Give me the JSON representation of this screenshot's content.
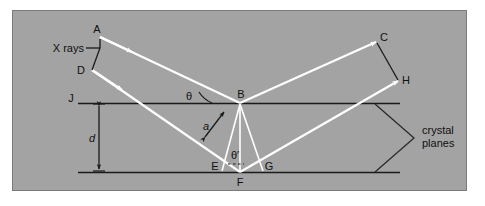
{
  "figure": {
    "panel": {
      "background_color": "#a3a3a3",
      "border_color": "#7b7b7b",
      "outer_background": "#ffffff",
      "x": 12,
      "y": 10,
      "width": 455,
      "height": 181
    },
    "colors": {
      "ray": "#ffffff",
      "plane": "#1a1a1a",
      "text": "#101010",
      "brace": "#2b2b2b",
      "dimension": "#1a1a1a"
    }
  },
  "labels": {
    "x_rays": "X rays",
    "crystal_planes_line1": "crystal",
    "crystal_planes_line2": "planes",
    "spacing": "d",
    "theta": "θ",
    "theta_prime": "θ′",
    "path_segment": "a"
  },
  "points": [
    {
      "id": "A",
      "label": "A",
      "x": 100,
      "y": 37,
      "label_x": 97,
      "label_y": 32
    },
    {
      "id": "D",
      "label": "D",
      "x": 92,
      "y": 70,
      "label_x": 82,
      "label_y": 73
    },
    {
      "id": "J",
      "label": "J",
      "x": 78,
      "y": 103,
      "label_x": 71,
      "label_y": 101
    },
    {
      "id": "B",
      "label": "B",
      "x": 240,
      "y": 103,
      "label_x": 240,
      "label_y": 96
    },
    {
      "id": "E",
      "label": "E",
      "x": 222,
      "y": 172,
      "label_x": 216,
      "label_y": 169
    },
    {
      "id": "F",
      "label": "F",
      "x": 240,
      "y": 172,
      "label_x": 240,
      "label_y": 186
    },
    {
      "id": "G",
      "label": "G",
      "x": 262,
      "y": 172,
      "label_x": 268,
      "label_y": 169
    },
    {
      "id": "C",
      "label": "C",
      "x": 375,
      "y": 42,
      "label_x": 383,
      "label_y": 40
    },
    {
      "id": "H",
      "label": "H",
      "x": 397,
      "y": 80,
      "label_x": 405,
      "label_y": 83
    }
  ],
  "geometry": {
    "plane_top_y": 103,
    "plane_bottom_y": 172,
    "plane_left_x": 78,
    "plane_right_x": 400,
    "spacing_arrow_x": 99,
    "brace_x_left": 375,
    "brace_x_tip": 415,
    "brace_label_x": 422
  },
  "rays": [
    {
      "name": "incident-upper",
      "from": "A",
      "to": "B"
    },
    {
      "name": "incident-lower",
      "from": "D",
      "to": "F"
    },
    {
      "name": "reflected-upper",
      "from": "B",
      "to": "C"
    },
    {
      "name": "reflected-lower",
      "from": "F",
      "to": "H"
    },
    {
      "name": "perpendicular-BE",
      "from": "B",
      "to": "E"
    },
    {
      "name": "perpendicular-BG",
      "from": "B",
      "to": "G"
    },
    {
      "name": "vertical-BF",
      "from": "B",
      "to": "F"
    }
  ],
  "wavefronts": [
    {
      "name": "incoming-wavefront-AD",
      "from": "A",
      "to": "D"
    },
    {
      "name": "outgoing-wavefront-CH",
      "from": "C",
      "to": "H"
    }
  ]
}
